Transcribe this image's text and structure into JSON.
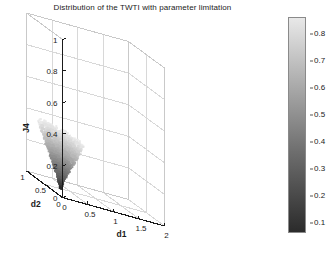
{
  "title": "Distribution of the TWTI with parameter limitation",
  "axes": {
    "x": {
      "label": "d1",
      "ticks": [
        "0",
        "0.5",
        "1",
        "1.5",
        "2"
      ],
      "range": [
        0,
        2
      ]
    },
    "y": {
      "label": "d2",
      "ticks": [
        "0",
        "0.5",
        "1"
      ],
      "range": [
        0,
        1
      ]
    },
    "z": {
      "label": "J4",
      "ticks": [
        "0",
        "0.2",
        "0.4",
        "0.6",
        "0.8",
        "1"
      ],
      "range": [
        0,
        1
      ]
    }
  },
  "colorbar": {
    "ticks": [
      "0.8",
      "0.7",
      "0.6",
      "0.5",
      "0.4",
      "0.3",
      "0.2",
      "0.1"
    ],
    "values": [
      0.8,
      0.7,
      0.6,
      0.5,
      0.4,
      0.3,
      0.2,
      0.1
    ],
    "min": 0.06,
    "max": 0.86,
    "colormap": "grayscale",
    "color_low": "#2b2b2b",
    "color_high": "#e8e8e8"
  },
  "colors": {
    "axis_line": "#1a1a1a",
    "grid_line": "#d8d8d8",
    "box_edge": "#c9c9c9",
    "text": "#1a1a1a",
    "background": "#ffffff"
  },
  "chart_data": {
    "type": "scatter",
    "title": "Distribution of the TWTI with parameter limitation",
    "xlabel": "d1",
    "ylabel": "d2",
    "zlabel": "J4",
    "xlim": [
      0,
      2
    ],
    "ylim": [
      0,
      1
    ],
    "zlim": [
      0,
      1
    ],
    "grid": true,
    "legend": false,
    "colorbar_label": "",
    "cluster": {
      "center_d1": 0.32,
      "center_d2": 0.5,
      "z_min": 0.0,
      "z_max": 0.35,
      "top_radius_d1": 0.28,
      "bottom_radius_d1": 0.02
    },
    "levels": [
      {
        "z": 0.35,
        "radius": 0.28,
        "value": 0.86,
        "count": 180
      },
      {
        "z": 0.335,
        "radius": 0.268,
        "value": 0.83,
        "count": 172
      },
      {
        "z": 0.32,
        "radius": 0.256,
        "value": 0.8,
        "count": 165
      },
      {
        "z": 0.305,
        "radius": 0.243,
        "value": 0.77,
        "count": 158
      },
      {
        "z": 0.29,
        "radius": 0.231,
        "value": 0.74,
        "count": 150
      },
      {
        "z": 0.275,
        "radius": 0.219,
        "value": 0.71,
        "count": 143
      },
      {
        "z": 0.26,
        "radius": 0.206,
        "value": 0.68,
        "count": 136
      },
      {
        "z": 0.245,
        "radius": 0.194,
        "value": 0.65,
        "count": 128
      },
      {
        "z": 0.23,
        "radius": 0.182,
        "value": 0.62,
        "count": 121
      },
      {
        "z": 0.215,
        "radius": 0.169,
        "value": 0.59,
        "count": 114
      },
      {
        "z": 0.2,
        "radius": 0.157,
        "value": 0.56,
        "count": 106
      },
      {
        "z": 0.185,
        "radius": 0.145,
        "value": 0.52,
        "count": 99
      },
      {
        "z": 0.17,
        "radius": 0.133,
        "value": 0.49,
        "count": 92
      },
      {
        "z": 0.155,
        "radius": 0.12,
        "value": 0.46,
        "count": 84
      },
      {
        "z": 0.14,
        "radius": 0.108,
        "value": 0.43,
        "count": 77
      },
      {
        "z": 0.125,
        "radius": 0.096,
        "value": 0.4,
        "count": 70
      },
      {
        "z": 0.11,
        "radius": 0.083,
        "value": 0.37,
        "count": 62
      },
      {
        "z": 0.095,
        "radius": 0.071,
        "value": 0.34,
        "count": 55
      },
      {
        "z": 0.08,
        "radius": 0.059,
        "value": 0.31,
        "count": 48
      },
      {
        "z": 0.065,
        "radius": 0.046,
        "value": 0.28,
        "count": 40
      },
      {
        "z": 0.05,
        "radius": 0.038,
        "value": 0.24,
        "count": 32
      },
      {
        "z": 0.038,
        "radius": 0.03,
        "value": 0.2,
        "count": 24
      },
      {
        "z": 0.026,
        "radius": 0.024,
        "value": 0.16,
        "count": 18
      },
      {
        "z": 0.014,
        "radius": 0.018,
        "value": 0.12,
        "count": 12
      },
      {
        "z": 0.004,
        "radius": 0.014,
        "value": 0.08,
        "count": 8
      }
    ]
  }
}
